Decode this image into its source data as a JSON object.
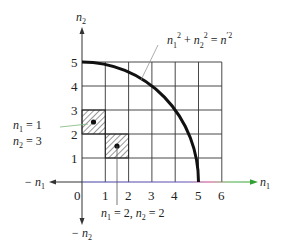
{
  "diagram": {
    "axes": {
      "x_label": "n",
      "x_sub": "1",
      "x_neg_label": "− n",
      "x_neg_sub": "1",
      "y_label": "n",
      "y_sub": "2",
      "y_neg_label": "− n",
      "y_neg_sub": "2",
      "origin_label": "0",
      "x_ticks": [
        "1",
        "2",
        "3",
        "4",
        "5",
        "6"
      ],
      "y_ticks": [
        "1",
        "2",
        "3",
        "4",
        "5"
      ]
    },
    "curve": {
      "equation_parts": [
        "n",
        "1",
        "2",
        " + ",
        "n",
        "2",
        "2",
        " = ",
        "n",
        "′2"
      ],
      "radius": 5
    },
    "highlighted_cells": [
      {
        "n1": 1,
        "n2": 3,
        "label_line1_var": "n",
        "label_line1_sub": "1",
        "label_line1_val": " = 1",
        "label_line2_var": "n",
        "label_line2_sub": "2",
        "label_line2_val": " = 3"
      },
      {
        "n1": 2,
        "n2": 2,
        "label_var1": "n",
        "label_sub1": "1",
        "label_val1": " = 2, ",
        "label_var2": "n",
        "label_sub2": "2",
        "label_val2": " = 2"
      }
    ],
    "colors": {
      "grid": "#333333",
      "curve": "#111111",
      "x_axis_gradient": [
        "#3a3aa0",
        "#d0407a",
        "#30b030"
      ],
      "leader_line": "#7ab87a"
    }
  }
}
